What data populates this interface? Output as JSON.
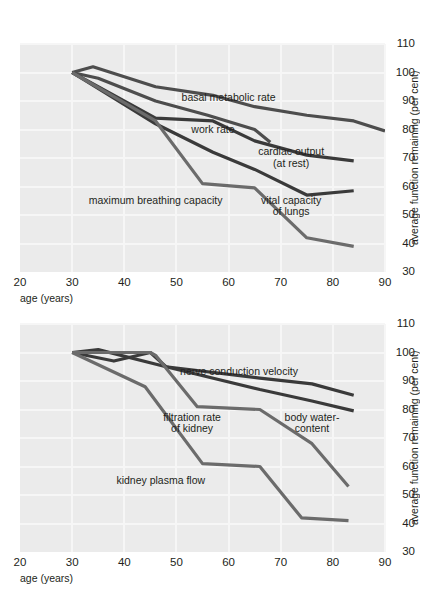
{
  "page": {
    "partial_caption_top": "",
    "axis_title_x": "age (years)",
    "axis_title_y": "average function remaining (per cent)"
  },
  "chart_data": [
    {
      "id": "chart-top",
      "type": "line",
      "title": "",
      "xlabel": "age (years)",
      "ylabel": "average function remaining (per cent)",
      "xlim": [
        20,
        90
      ],
      "ylim": [
        30,
        110
      ],
      "xticks": [
        20,
        30,
        40,
        50,
        60,
        70,
        80,
        90
      ],
      "yticks": [
        30,
        40,
        50,
        60,
        70,
        80,
        90,
        100,
        110
      ],
      "grid": true,
      "legend": "inline-annotations",
      "series": [
        {
          "name": "basal metabolic rate",
          "color": "#4d4d4d",
          "points": [
            [
              30,
              100
            ],
            [
              34,
              102
            ],
            [
              46,
              95
            ],
            [
              57,
              92
            ],
            [
              65,
              88
            ],
            [
              75,
              85
            ],
            [
              84,
              83
            ],
            [
              90,
              79.5
            ]
          ]
        },
        {
          "name": "work rate",
          "color": "#4d4d4d",
          "points": [
            [
              30,
              100
            ],
            [
              35,
              98
            ],
            [
              46,
              90
            ],
            [
              56,
              85
            ],
            [
              65,
              80
            ],
            [
              68,
              75.5
            ]
          ]
        },
        {
          "name": "cardiac output (at rest)",
          "color": "#3a3a3a",
          "points": [
            [
              30,
              100
            ],
            [
              46,
              84
            ],
            [
              57,
              83
            ],
            [
              65,
              76
            ],
            [
              75,
              71
            ],
            [
              84,
              69
            ]
          ]
        },
        {
          "name": "vital capacity of lungs",
          "color": "#3a3a3a",
          "points": [
            [
              30,
              100
            ],
            [
              46,
              82
            ],
            [
              57,
              72
            ],
            [
              65,
              66
            ],
            [
              75,
              57
            ],
            [
              84,
              58.5
            ]
          ]
        },
        {
          "name": "maximum breathing capacity",
          "color": "#6b6b6b",
          "points": [
            [
              30,
              100
            ],
            [
              46,
              83
            ],
            [
              55,
              61
            ],
            [
              65,
              59.5
            ],
            [
              75,
              42
            ],
            [
              84,
              39
            ]
          ]
        }
      ],
      "annotations": [
        {
          "text": "basal metabolic rate",
          "x": 60,
          "y": 91
        },
        {
          "text": "work rate",
          "x": 57,
          "y": 80
        },
        {
          "text": "cardiac output",
          "x": 72,
          "y": 72
        },
        {
          "text": "(at rest)",
          "x": 72,
          "y": 68
        },
        {
          "text": "maximum breathing capacity",
          "x": 46,
          "y": 55
        },
        {
          "text": "vital capacity",
          "x": 72,
          "y": 55
        },
        {
          "text": "of lungs",
          "x": 72,
          "y": 51
        }
      ]
    },
    {
      "id": "chart-bottom",
      "type": "line",
      "title": "",
      "xlabel": "age (years)",
      "ylabel": "average function remaining (per cent)",
      "xlim": [
        20,
        90
      ],
      "ylim": [
        30,
        110
      ],
      "xticks": [
        20,
        30,
        40,
        50,
        60,
        70,
        80,
        90
      ],
      "yticks": [
        30,
        40,
        50,
        60,
        70,
        80,
        90,
        100,
        110
      ],
      "grid": true,
      "legend": "inline-annotations",
      "series": [
        {
          "name": "nerve conduction velocity",
          "color": "#3a3a3a",
          "points": [
            [
              30,
              100
            ],
            [
              35,
              101
            ],
            [
              48,
              95
            ],
            [
              66,
              91
            ],
            [
              76,
              89
            ],
            [
              84,
              85
            ]
          ]
        },
        {
          "name": "body water-content",
          "color": "#3a3a3a",
          "points": [
            [
              30,
              100
            ],
            [
              38,
              97
            ],
            [
              45,
              100
            ],
            [
              48,
              95
            ],
            [
              66,
              87
            ],
            [
              76,
              83
            ],
            [
              84,
              79.5
            ]
          ]
        },
        {
          "name": "filtration rate of kidney",
          "color": "#6b6b6b",
          "points": [
            [
              30,
              100
            ],
            [
              45,
              100
            ],
            [
              46,
              99
            ],
            [
              54,
              81
            ],
            [
              66,
              80
            ],
            [
              76,
              68
            ],
            [
              83,
              53
            ]
          ]
        },
        {
          "name": "kidney plasma flow",
          "color": "#6b6b6b",
          "points": [
            [
              30,
              100
            ],
            [
              44,
              88
            ],
            [
              55,
              61
            ],
            [
              66,
              60
            ],
            [
              74,
              42
            ],
            [
              83,
              41
            ]
          ]
        }
      ],
      "annotations": [
        {
          "text": "nerve conduction velocity",
          "x": 62,
          "y": 93
        },
        {
          "text": "filtration rate",
          "x": 53,
          "y": 77
        },
        {
          "text": "of kidney",
          "x": 53,
          "y": 73
        },
        {
          "text": "body water-",
          "x": 76,
          "y": 77
        },
        {
          "text": "content",
          "x": 76,
          "y": 73
        },
        {
          "text": "kidney plasma flow",
          "x": 47,
          "y": 55
        }
      ]
    }
  ]
}
